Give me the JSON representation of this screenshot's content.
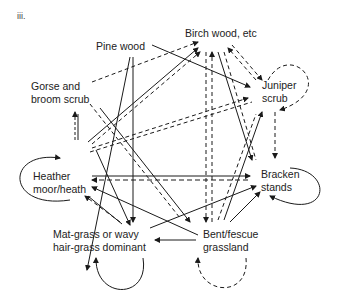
{
  "section_label": "iii.",
  "nodes": {
    "pine_wood": {
      "lines": [
        "Pine wood"
      ]
    },
    "birch_wood": {
      "lines": [
        "Birch wood, etc"
      ]
    },
    "gorse_broom": {
      "lines": [
        "Gorse and",
        "broom scrub"
      ]
    },
    "juniper": {
      "lines": [
        "Juniper",
        "scrub"
      ]
    },
    "heather": {
      "lines": [
        "Heather",
        "moor/heath"
      ]
    },
    "bracken": {
      "lines": [
        "Bracken",
        "stands"
      ]
    },
    "matgrass": {
      "lines": [
        "Mat-grass or wavy",
        "hair-grass dominant"
      ]
    },
    "bent_fescue": {
      "lines": [
        "Bent/fescue",
        "grassland"
      ]
    }
  },
  "legend": {
    "solid": "solid arrow",
    "dashed": "dashed arrow"
  }
}
